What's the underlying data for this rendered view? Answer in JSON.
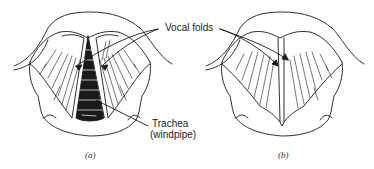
{
  "figure": {
    "labels": {
      "vocal_folds": "Vocal folds",
      "trachea_line1": "Trachea",
      "trachea_line2": "(windpipe)"
    },
    "panels": [
      {
        "id": "a",
        "caption": "(a)",
        "state": "open"
      },
      {
        "id": "b",
        "caption": "(b)",
        "state": "closed"
      }
    ],
    "colors": {
      "ink": "#1a1a1a",
      "background": "#ffffff"
    }
  }
}
